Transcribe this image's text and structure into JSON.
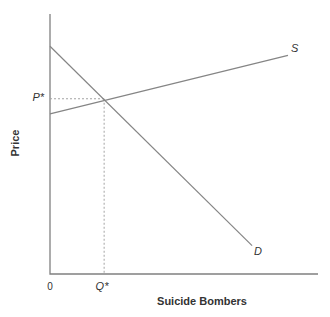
{
  "figure": {
    "background": "#ffffff"
  },
  "chart_data": {
    "type": "line",
    "title": "",
    "xlabel": "Suicide Bombers",
    "ylabel": "Price",
    "origin_label": "0",
    "grid": false,
    "legend": "none",
    "axes": {
      "x_tick_labels": [
        "0",
        "Q*"
      ],
      "y_tick_labels": [
        "P*"
      ]
    },
    "series": [
      {
        "name": "S",
        "role": "supply-curve",
        "points": [
          [
            0.0,
            0.616
          ],
          [
            0.888,
            0.841
          ]
        ]
      },
      {
        "name": "D",
        "role": "demand-curve",
        "points": [
          [
            0.0,
            0.876
          ],
          [
            0.754,
            0.109
          ]
        ]
      }
    ],
    "equilibrium": {
      "price_label": "P*",
      "quantity_label": "Q*",
      "point": [
        0.202,
        0.674
      ],
      "guide_style": "dotted"
    },
    "colors": {
      "axis": "#808080",
      "curve": "#858585",
      "guide": "#a3a3a3",
      "text": "#333333"
    }
  }
}
